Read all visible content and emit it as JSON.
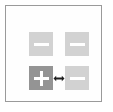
{
  "panel": {
    "name": "button-grid-panel",
    "border_color": "#9a9a9a",
    "background_color": "#fefefe"
  },
  "colors": {
    "button_normal": "#d2d2d2",
    "button_selected": "#949494",
    "glyph": "#ffffff",
    "arrow": "#1d1d1d",
    "border": "#9a9a9a"
  },
  "grid": {
    "rows": 2,
    "columns": 2,
    "buttons": [
      {
        "id": "top-left",
        "icon": "minus-icon",
        "label": "−",
        "state": "normal",
        "selected": false
      },
      {
        "id": "top-right",
        "icon": "minus-icon",
        "label": "−",
        "state": "normal",
        "selected": false
      },
      {
        "id": "bottom-left",
        "icon": "plus-icon",
        "label": "+",
        "state": "selected",
        "selected": true
      },
      {
        "id": "bottom-right",
        "icon": "minus-icon",
        "label": "−",
        "state": "normal",
        "selected": false
      }
    ]
  },
  "connector": {
    "icon": "left-right-arrow-icon",
    "label": "↔"
  }
}
